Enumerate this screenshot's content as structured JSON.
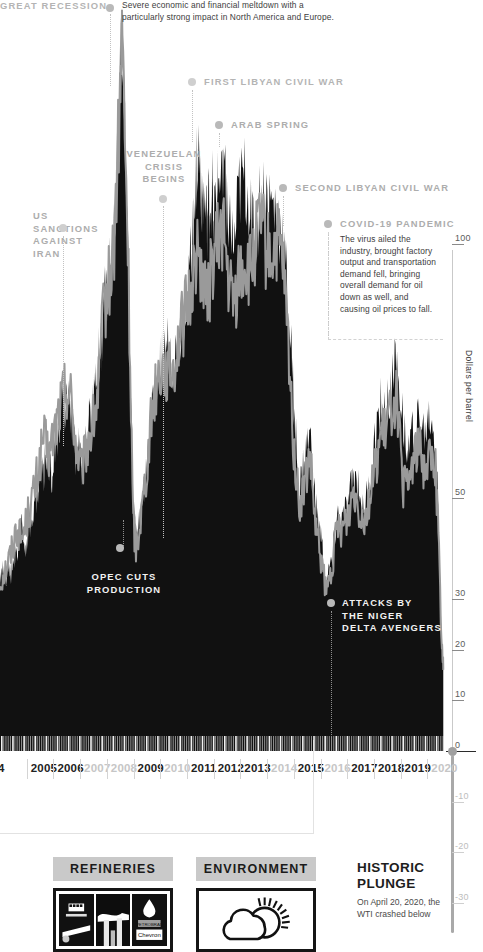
{
  "chart_data": {
    "type": "area",
    "ylabel": "Dollars per barrel",
    "xlabel": "",
    "ylim": [
      -40,
      115
    ],
    "xlim": [
      2004,
      2020.4
    ],
    "grid": false,
    "legend_position": "none",
    "y_ticks": [
      {
        "value": 100,
        "label": "100"
      },
      {
        "value": 50,
        "label": "50"
      },
      {
        "value": 30,
        "label": "30"
      },
      {
        "value": 20,
        "label": "20"
      },
      {
        "value": 10,
        "label": "10"
      },
      {
        "value": 0,
        "label": "0"
      },
      {
        "value": -10,
        "label": "-10"
      },
      {
        "value": -20,
        "label": "-20"
      },
      {
        "value": -30,
        "label": "-30"
      }
    ],
    "x_tick_labels": [
      "4",
      "2005",
      "2006",
      "2007",
      "2008",
      "2009",
      "2010",
      "2011",
      "2012",
      "2013",
      "2014",
      "2015",
      "2016",
      "2017",
      "2018",
      "2019",
      "2020"
    ],
    "x_tick_dimmed": [
      false,
      false,
      false,
      true,
      true,
      false,
      true,
      false,
      false,
      false,
      true,
      false,
      true,
      false,
      false,
      false,
      true
    ],
    "series": [
      {
        "name": "Brent (filled area)",
        "color": "#111111",
        "x": [
          2004.0,
          2004.1,
          2004.2,
          2004.3,
          2004.4,
          2004.5,
          2004.6,
          2004.7,
          2004.8,
          2004.9,
          2005.0,
          2005.1,
          2005.2,
          2005.3,
          2005.4,
          2005.5,
          2005.6,
          2005.7,
          2005.8,
          2005.9,
          2006.0,
          2006.1,
          2006.2,
          2006.3,
          2006.4,
          2006.5,
          2006.6,
          2006.7,
          2006.8,
          2006.9,
          2007.0,
          2007.1,
          2007.2,
          2007.3,
          2007.4,
          2007.5,
          2007.6,
          2007.7,
          2007.8,
          2007.9,
          2008.0,
          2008.1,
          2008.2,
          2008.3,
          2008.4,
          2008.5,
          2008.6,
          2008.7,
          2008.8,
          2008.9,
          2009.0,
          2009.1,
          2009.2,
          2009.3,
          2009.4,
          2009.5,
          2009.6,
          2009.7,
          2009.8,
          2009.9,
          2010.0,
          2010.2,
          2010.4,
          2010.6,
          2010.8,
          2011.0,
          2011.1,
          2011.2,
          2011.3,
          2011.4,
          2011.5,
          2011.6,
          2011.7,
          2011.8,
          2011.9,
          2012.0,
          2012.2,
          2012.4,
          2012.6,
          2012.8,
          2013.0,
          2013.2,
          2013.4,
          2013.6,
          2013.8,
          2014.0,
          2014.2,
          2014.4,
          2014.6,
          2014.8,
          2015.0,
          2015.2,
          2015.4,
          2015.6,
          2015.8,
          2016.0,
          2016.2,
          2016.4,
          2016.6,
          2016.8,
          2017.0,
          2017.2,
          2017.4,
          2017.6,
          2017.8,
          2018.0,
          2018.2,
          2018.4,
          2018.6,
          2018.8,
          2019.0,
          2019.2,
          2019.4,
          2019.6,
          2019.8,
          2020.0,
          2020.1,
          2020.25,
          2020.3
        ],
        "y": [
          34,
          36,
          33,
          38,
          35,
          40,
          37,
          42,
          44,
          40,
          43,
          46,
          44,
          52,
          49,
          58,
          55,
          60,
          57,
          54,
          60,
          63,
          66,
          70,
          67,
          72,
          68,
          63,
          58,
          60,
          56,
          58,
          62,
          65,
          68,
          72,
          76,
          80,
          86,
          92,
          92,
          96,
          104,
          118,
          133,
          143,
          120,
          100,
          72,
          48,
          42,
          44,
          48,
          52,
          56,
          62,
          68,
          70,
          74,
          76,
          78,
          80,
          76,
          82,
          88,
          96,
          104,
          115,
          118,
          112,
          108,
          104,
          108,
          110,
          106,
          110,
          118,
          105,
          98,
          110,
          112,
          108,
          100,
          110,
          108,
          107,
          105,
          100,
          88,
          70,
          50,
          58,
          62,
          48,
          42,
          32,
          38,
          46,
          45,
          48,
          54,
          52,
          48,
          52,
          62,
          68,
          66,
          72,
          78,
          68,
          58,
          64,
          66,
          62,
          66,
          62,
          50,
          22,
          18
        ]
      },
      {
        "name": "WTI (grey line)",
        "color": "#9a9a9a",
        "x": [
          2004.0,
          2004.2,
          2004.4,
          2004.6,
          2004.8,
          2005.0,
          2005.2,
          2005.4,
          2005.6,
          2005.8,
          2006.0,
          2006.2,
          2006.4,
          2006.6,
          2006.8,
          2007.0,
          2007.2,
          2007.4,
          2007.6,
          2007.8,
          2008.0,
          2008.2,
          2008.4,
          2008.5,
          2008.7,
          2008.9,
          2009.0,
          2009.2,
          2009.4,
          2009.6,
          2009.8,
          2010.0,
          2010.2,
          2010.4,
          2010.6,
          2010.8,
          2011.0,
          2011.2,
          2011.4,
          2011.6,
          2011.8,
          2012.0,
          2012.2,
          2012.4,
          2012.6,
          2012.8,
          2013.0,
          2013.2,
          2013.4,
          2013.6,
          2013.8,
          2014.0,
          2014.2,
          2014.4,
          2014.6,
          2014.8,
          2015.0,
          2015.2,
          2015.4,
          2015.6,
          2015.8,
          2016.0,
          2016.2,
          2016.4,
          2016.6,
          2016.8,
          2017.0,
          2017.2,
          2017.4,
          2017.6,
          2017.8,
          2018.0,
          2018.2,
          2018.4,
          2018.6,
          2018.8,
          2019.0,
          2019.2,
          2019.4,
          2019.6,
          2019.8,
          2020.0,
          2020.1,
          2020.25,
          2020.3
        ],
        "y": [
          33,
          36,
          39,
          44,
          42,
          46,
          50,
          55,
          62,
          58,
          63,
          68,
          72,
          70,
          60,
          55,
          60,
          64,
          70,
          86,
          92,
          100,
          126,
          140,
          100,
          45,
          40,
          47,
          56,
          68,
          74,
          76,
          74,
          76,
          82,
          86,
          90,
          98,
          96,
          88,
          96,
          100,
          104,
          92,
          88,
          94,
          96,
          94,
          100,
          104,
          98,
          98,
          100,
          96,
          80,
          60,
          48,
          52,
          58,
          44,
          38,
          31,
          36,
          44,
          44,
          46,
          52,
          48,
          46,
          50,
          56,
          62,
          63,
          68,
          70,
          52,
          52,
          58,
          60,
          56,
          58,
          57,
          46,
          20,
          16
        ]
      }
    ],
    "events": [
      {
        "id": "great-recession",
        "label": "GREAT RECESSION",
        "x": 2008.5,
        "dot_xy": [
          110,
          8
        ]
      },
      {
        "id": "first-libyan-civil-war",
        "label": "FIRST LIBYAN CIVIL WAR",
        "x": 2011.15,
        "dot_xy": [
          192,
          82
        ]
      },
      {
        "id": "arab-spring",
        "label": "ARAB SPRING",
        "x": 2011.9,
        "dot_xy": [
          219,
          125
        ]
      },
      {
        "id": "venezuelan-crisis-begins",
        "label": "VENEZUELAN CRISIS BEGINS",
        "x": 2009.9,
        "dot_xy": [
          163,
          199
        ]
      },
      {
        "id": "second-libyan-civil-war",
        "label": "SECOND LIBYAN CIVIL WAR",
        "x": 2013.9,
        "dot_xy": [
          283,
          188
        ]
      },
      {
        "id": "us-sanctions-against-iran",
        "label": "US SANCTIONS AGAINST IRAN",
        "x": 2006.6,
        "dot_xy": [
          63,
          228
        ]
      },
      {
        "id": "opec-cuts-production",
        "label": "OPEC CUTS PRODUCTION",
        "x": 2008.9,
        "dot_xy": [
          120,
          548
        ]
      },
      {
        "id": "attacks-by-the-niger-delta-avengers",
        "label": "ATTACKS BY THE NIGER DELTA AVENGERS",
        "x": 2016.0,
        "dot_xy": [
          331,
          603
        ]
      },
      {
        "id": "covid-19-pandemic",
        "label": "COVID-19 PANDEMIC",
        "x": 2020.1,
        "dot_xy": [
          328,
          224
        ]
      }
    ]
  },
  "annotations": {
    "great_recession": {
      "title": "GREAT RECESSION",
      "body": "Severe economic and financial meltdown with a particularly strong impact in North America and Europe."
    },
    "first_libyan": {
      "title": "FIRST LIBYAN CIVIL WAR"
    },
    "arab_spring": {
      "title": "ARAB SPRING"
    },
    "venezuelan_crisis": {
      "title_line1": "VENEZUELAN",
      "title_line2": "CRISIS",
      "title_line3": "BEGINS"
    },
    "second_libyan": {
      "title": "SECOND LIBYAN CIVIL WAR"
    },
    "us_sanctions": {
      "title_line1": "US",
      "title_line2": "SANCTIONS",
      "title_line3": "AGAINST",
      "title_line4": "IRAN"
    },
    "opec_cuts": {
      "title_line1": "OPEC CUTS",
      "title_line2": "PRODUCTION"
    },
    "niger_delta": {
      "title_line1": "ATTACKS BY",
      "title_line2": "THE NIGER",
      "title_line3": "DELTA AVENGERS"
    },
    "covid": {
      "title": "COVID-19 PANDEMIC",
      "body": "The virus ailed the industry, brought factory output and transportation demand fell, bringing overall demand for oil down as well, and causing oil prices to fall."
    }
  },
  "axis": {
    "title": "Dollars per barrel",
    "ticks_upper": [
      "100",
      "50",
      "30",
      "20",
      "10",
      "0"
    ],
    "ticks_lower": [
      "-10",
      "-20",
      "-30"
    ]
  },
  "cards": [
    {
      "id": "refineries",
      "header": "REFINERIES",
      "icon": "refinery-photos-icon"
    },
    {
      "id": "environment",
      "header": "ENVIRONMENT",
      "icon": "cloud-sun-icon"
    }
  ],
  "historic_plunge": {
    "title_line1": "HISTORIC",
    "title_line2": "PLUNGE",
    "body": "On April 20, 2020, the WTI crashed below"
  },
  "colors": {
    "area_fill": "#111111",
    "line_grey": "#9a9a9a",
    "annotation_grey": "#b4b4b4",
    "card_header_bg": "#c9c9c9",
    "background": "#ffffff"
  }
}
